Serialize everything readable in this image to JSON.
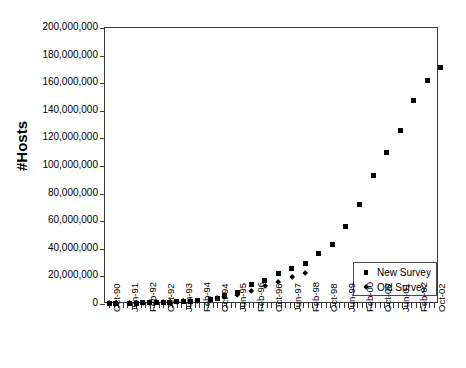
{
  "chart_data": {
    "type": "scatter",
    "title": "",
    "xlabel": "",
    "ylabel": "#Hosts",
    "ylim": [
      0,
      200000000
    ],
    "y_ticks": [
      0,
      20000000,
      40000000,
      60000000,
      80000000,
      100000000,
      120000000,
      140000000,
      160000000,
      180000000,
      200000000
    ],
    "y_tick_labels": [
      "0",
      "20,000,000",
      "40,000,000",
      "60,000,000",
      "80,000,000",
      "100,000,000",
      "120,000,000",
      "140,000,000",
      "160,000,000",
      "180,000,000",
      "200,000,000"
    ],
    "grid": false,
    "legend_position": "lower-right",
    "x_tick_labels": [
      "Oct-90",
      "Jun-91",
      "Feb-92",
      "Oct-92",
      "Jun-93",
      "Feb-94",
      "Oct-94",
      "Jun-95",
      "Feb-96",
      "Oct-96",
      "Jun-97",
      "Feb-98",
      "Oct-98",
      "Jun-99",
      "Feb-00",
      "Oct-00",
      "Jun-01",
      "Feb-02",
      "Oct-02"
    ],
    "x_tick_label_interval_ticks": 4,
    "x_tick_count": 73,
    "x_axis_start": "Oct-90",
    "x_axis_end": "Oct-02",
    "series": [
      {
        "name": "New Survey",
        "marker": "square",
        "color": "#000000",
        "points": [
          {
            "x": "Oct-90",
            "y": 313000
          },
          {
            "x": "Jan-91",
            "y": 376000
          },
          {
            "x": "Jul-91",
            "y": 535000
          },
          {
            "x": "Oct-91",
            "y": 617000
          },
          {
            "x": "Jan-92",
            "y": 727000
          },
          {
            "x": "Apr-92",
            "y": 890000
          },
          {
            "x": "Jul-92",
            "y": 992000
          },
          {
            "x": "Oct-92",
            "y": 1136000
          },
          {
            "x": "Jan-93",
            "y": 1313000
          },
          {
            "x": "Apr-93",
            "y": 1486000
          },
          {
            "x": "Jul-93",
            "y": 1776000
          },
          {
            "x": "Oct-93",
            "y": 2056000
          },
          {
            "x": "Jan-94",
            "y": 2217000
          },
          {
            "x": "Jul-94",
            "y": 3212000
          },
          {
            "x": "Oct-94",
            "y": 3864000
          },
          {
            "x": "Jan-95",
            "y": 5846000
          },
          {
            "x": "Jul-95",
            "y": 8200000
          },
          {
            "x": "Jan-96",
            "y": 14352000
          },
          {
            "x": "Jul-96",
            "y": 16729000
          },
          {
            "x": "Jan-97",
            "y": 21819000
          },
          {
            "x": "Jul-97",
            "y": 26053000
          },
          {
            "x": "Jan-98",
            "y": 29670000
          },
          {
            "x": "Jul-98",
            "y": 36739000
          },
          {
            "x": "Jan-99",
            "y": 43230000
          },
          {
            "x": "Jul-99",
            "y": 56218000
          },
          {
            "x": "Jan-00",
            "y": 72398000
          },
          {
            "x": "Jul-00",
            "y": 93047000
          },
          {
            "x": "Jan-01",
            "y": 109574000
          },
          {
            "x": "Jul-01",
            "y": 125888000
          },
          {
            "x": "Jan-02",
            "y": 147345000
          },
          {
            "x": "Jul-02",
            "y": 162128000
          },
          {
            "x": "Jan-03",
            "y": 171638000
          }
        ]
      },
      {
        "name": "Old Survey",
        "marker": "diamond",
        "color": "#000000",
        "points": [
          {
            "x": "Oct-90",
            "y": 313000
          },
          {
            "x": "Jan-91",
            "y": 376000
          },
          {
            "x": "Jul-91",
            "y": 535000
          },
          {
            "x": "Oct-91",
            "y": 617000
          },
          {
            "x": "Jan-92",
            "y": 727000
          },
          {
            "x": "Apr-92",
            "y": 890000
          },
          {
            "x": "Jul-92",
            "y": 992000
          },
          {
            "x": "Oct-92",
            "y": 1136000
          },
          {
            "x": "Jan-93",
            "y": 1313000
          },
          {
            "x": "Apr-93",
            "y": 1486000
          },
          {
            "x": "Jul-93",
            "y": 1776000
          },
          {
            "x": "Oct-93",
            "y": 2056000
          },
          {
            "x": "Jan-94",
            "y": 2217000
          },
          {
            "x": "Jul-94",
            "y": 3212000
          },
          {
            "x": "Oct-94",
            "y": 3864000
          },
          {
            "x": "Jan-95",
            "y": 4852000
          },
          {
            "x": "Jul-95",
            "y": 6642000
          },
          {
            "x": "Jan-96",
            "y": 9472000
          },
          {
            "x": "Jul-96",
            "y": 12881000
          },
          {
            "x": "Jan-97",
            "y": 16146000
          },
          {
            "x": "Jul-97",
            "y": 19540000
          },
          {
            "x": "Jan-98",
            "y": 22000000
          }
        ]
      }
    ],
    "legend": [
      {
        "label": "New Survey",
        "marker": "square"
      },
      {
        "label": "Old Survey",
        "marker": "diamond"
      }
    ]
  }
}
